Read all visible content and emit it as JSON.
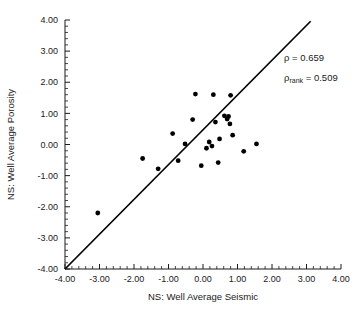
{
  "chart_data": {
    "type": "scatter",
    "title": "",
    "xlabel": "NS: Well Average Seismic",
    "ylabel": "NS: Well Average Porosity",
    "xlim": [
      -4.0,
      4.0
    ],
    "ylim": [
      -4.0,
      4.0
    ],
    "xticks": [
      "-4.00",
      "-3.00",
      "-2.00",
      "-1.00",
      "0.00",
      "1.00",
      "2.00",
      "3.00",
      "4.00"
    ],
    "yticks": [
      "4.00",
      "3.00",
      "2.00",
      "1.00",
      "0.00",
      "-1.00",
      "-2.00",
      "-3.00",
      "-4.00"
    ],
    "xtick_values": [
      -4,
      -3,
      -2,
      -1,
      0,
      1,
      2,
      3,
      4
    ],
    "ytick_values": [
      4,
      3,
      2,
      1,
      0,
      -1,
      -2,
      -3,
      -4
    ],
    "minor_ticks_per_interval": 4,
    "grid": false,
    "legend": "none",
    "marker": "filled-circle",
    "marker_color": "#000000",
    "point_count": 24,
    "points": [
      {
        "x": -3.05,
        "y": -2.2
      },
      {
        "x": -1.75,
        "y": -0.45
      },
      {
        "x": -1.3,
        "y": -0.78
      },
      {
        "x": -0.88,
        "y": 0.35
      },
      {
        "x": -0.72,
        "y": -0.52
      },
      {
        "x": -0.3,
        "y": 0.8
      },
      {
        "x": -0.22,
        "y": 1.62
      },
      {
        "x": -0.05,
        "y": -0.68
      },
      {
        "x": 0.1,
        "y": -0.12
      },
      {
        "x": 0.18,
        "y": 0.08
      },
      {
        "x": 0.26,
        "y": -0.05
      },
      {
        "x": 0.3,
        "y": 1.6
      },
      {
        "x": 0.36,
        "y": 0.72
      },
      {
        "x": 0.48,
        "y": 0.18
      },
      {
        "x": 0.62,
        "y": 0.92
      },
      {
        "x": 0.7,
        "y": 0.82
      },
      {
        "x": 0.74,
        "y": 0.9
      },
      {
        "x": 0.78,
        "y": 0.66
      },
      {
        "x": 0.8,
        "y": 1.58
      },
      {
        "x": 0.86,
        "y": 0.3
      },
      {
        "x": 1.18,
        "y": -0.22
      },
      {
        "x": 1.55,
        "y": 0.02
      },
      {
        "x": -0.52,
        "y": 0.02
      },
      {
        "x": 0.44,
        "y": -0.58
      }
    ],
    "fit_line": {
      "x_start": -4.0,
      "y_start": -4.0,
      "x_end": 3.12,
      "y_end": 3.96
    },
    "annotations": [
      {
        "text": "ρ = 0.659",
        "x": 2.35,
        "y": 2.68
      },
      {
        "text": "ρ",
        "subscript": "rank",
        "rest": " = 0.509",
        "x": 2.35,
        "y": 2.05
      }
    ]
  },
  "annotation_text": {
    "rho_label": "ρ = 0.659",
    "rho_rank_symbol": "ρ",
    "rho_rank_sub": "rank",
    "rho_rank_value": " = 0.509"
  }
}
